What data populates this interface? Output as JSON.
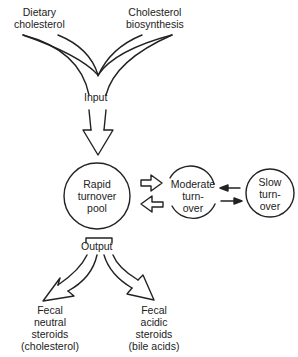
{
  "inputs": {
    "dietary": [
      "Dietary",
      "cholesterol"
    ],
    "biosynthesis": [
      "Cholesterol",
      "biosynthesis"
    ],
    "input_label": "Input"
  },
  "pools": {
    "rapid": [
      "Rapid",
      "turnover",
      "pool"
    ],
    "moderate": [
      "Moderate",
      "turn-",
      "over"
    ],
    "slow": [
      "Slow",
      "turn-",
      "over"
    ]
  },
  "outputs": {
    "output_label": "Output",
    "neutral": [
      "Fecal",
      "neutral",
      "steroids",
      "(cholesterol)"
    ],
    "acidic": [
      "Fecal",
      "acidic",
      "steroids",
      "(bile acids)"
    ]
  },
  "colors": {
    "stroke": "#222222",
    "background": "#ffffff"
  }
}
